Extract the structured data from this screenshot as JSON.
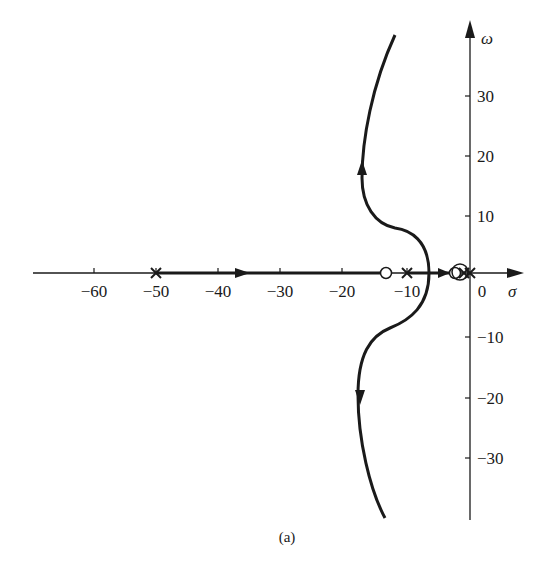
{
  "figure": {
    "caption": "(a)",
    "type": "root-locus",
    "x_axis": {
      "label": "σ",
      "ticks": [
        {
          "value": -60,
          "label": "−60"
        },
        {
          "value": -50,
          "label": "−50"
        },
        {
          "value": -40,
          "label": "−40"
        },
        {
          "value": -30,
          "label": "−30"
        },
        {
          "value": -20,
          "label": "−20"
        },
        {
          "value": -10,
          "label": "−10"
        },
        {
          "value": 0,
          "label": "0"
        }
      ]
    },
    "y_axis": {
      "label": "ω",
      "ticks": [
        {
          "value": 30,
          "label": "30"
        },
        {
          "value": 20,
          "label": "20"
        },
        {
          "value": 10,
          "label": "10"
        },
        {
          "value": -10,
          "label": "−10"
        },
        {
          "value": -20,
          "label": "−20"
        },
        {
          "value": -30,
          "label": "−30"
        }
      ]
    },
    "poles": [
      -50,
      -9,
      -1,
      0
    ],
    "zeros": [
      -12,
      -2.5,
      -1.5
    ],
    "branches": [
      {
        "name": "real-axis-branch",
        "from": -50,
        "to": -12
      },
      {
        "name": "upper-branch",
        "direction": "up"
      },
      {
        "name": "lower-branch",
        "direction": "down"
      },
      {
        "name": "near-origin-branch",
        "from": -9,
        "to": -2.5
      }
    ],
    "colors": {
      "ink": "#1a1a1a",
      "background": "#ffffff"
    }
  }
}
